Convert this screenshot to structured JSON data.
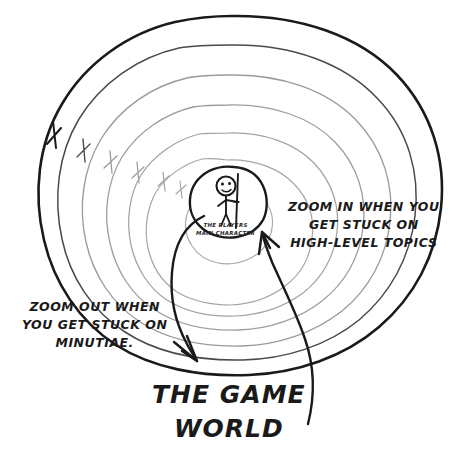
{
  "diagram": {
    "title_lines": [
      "THE GAME",
      "WORLD"
    ],
    "center": {
      "caption_lines": [
        "THE PLAYERS",
        "MAIN CHARACTER"
      ],
      "figure": "stick-figure-with-staff"
    },
    "annotations": {
      "zoom_in": {
        "lines": [
          "ZOOM IN WHEN YOU",
          "GET STUCK ON",
          "HIGH-LEVEL TOPICS"
        ]
      },
      "zoom_out": {
        "lines": [
          "ZOOM OUT WHEN",
          "YOU GET STUCK ON",
          "MINUTIAE."
        ]
      }
    },
    "rings": {
      "count": 7,
      "outer_color": "#1a1a1a",
      "inner_color": "#9a9a9a"
    },
    "arrows": {
      "zoom_out_arrow": "curve-from-center-to-bottom-left",
      "zoom_in_arrow": "curve-from-bottom-right-to-center"
    },
    "colors": {
      "ink": "#1a1a1a",
      "ring_light": "#a0a0a0",
      "background": "#ffffff"
    }
  }
}
